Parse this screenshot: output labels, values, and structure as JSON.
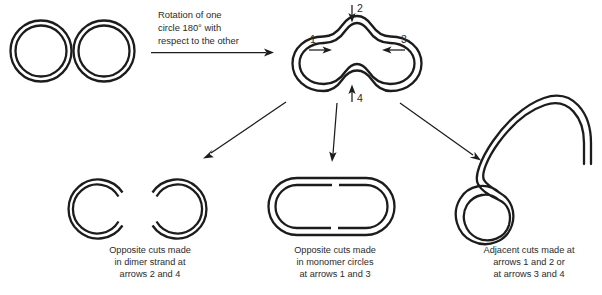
{
  "figure": {
    "background_color": "#ffffff",
    "line_color": "#1c1c1c",
    "text_color": "#2a2a2a"
  },
  "step_label": {
    "line1": "Rotation of one",
    "line2": "circle 180° with",
    "line3": "respect to the other"
  },
  "arrow_labels": {
    "one": "1",
    "two": "2",
    "three": "3",
    "four": "4"
  },
  "outcomes": [
    {
      "id": "dimer-strand-cuts",
      "caption_line1": "Opposite cuts made",
      "caption_line2": "in dimer strand at",
      "caption_line3": "arrows 2 and 4"
    },
    {
      "id": "monomer-circle-cuts",
      "caption_line1": "Opposite cuts made",
      "caption_line2": "in monomer circles",
      "caption_line3": "at arrows 1 and 3"
    },
    {
      "id": "adjacent-cuts",
      "caption_line1": "Adjacent cuts made at",
      "caption_line2": "arrows 1 and 2 or",
      "caption_line3": "at arrows 3 and 4"
    }
  ]
}
